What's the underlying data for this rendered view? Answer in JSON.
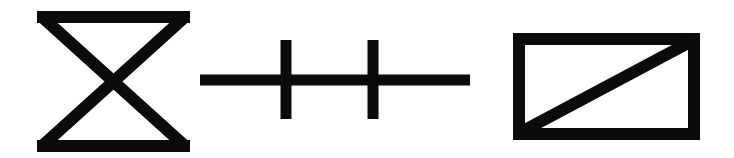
{
  "canvas": {
    "width": 734,
    "height": 158,
    "background_color": "#ffffff",
    "ink_color": "#0b0b0b",
    "description": "Three black line-art symbols arranged in a horizontal row on a plain white background"
  },
  "symbols": [
    {
      "id": "bowtie",
      "name": "bowtie-hourglass-symbol",
      "label": "Bowtie / hourglass (X between horizontal bars)",
      "order": 1,
      "bbox": {
        "x": 37,
        "y": 11,
        "width": 153,
        "height": 141
      },
      "stroke_width": 12,
      "geometry": {
        "top_bar": {
          "x1": 37,
          "y1": 17,
          "x2": 190,
          "y2": 17
        },
        "bottom_bar": {
          "x1": 37,
          "y1": 146,
          "x2": 190,
          "y2": 146
        },
        "diagonal_a": {
          "x1": 41,
          "y1": 16,
          "x2": 186,
          "y2": 147
        },
        "diagonal_b": {
          "x1": 186,
          "y1": 16,
          "x2": 41,
          "y2": 147
        },
        "crossing_point": {
          "x": 113,
          "y": 82
        }
      }
    },
    {
      "id": "double-cross-line",
      "name": "double-cross-line-symbol",
      "label": "Horizontal line crossed by two vertical bars",
      "order": 2,
      "bbox": {
        "x": 200,
        "y": 40,
        "width": 270,
        "height": 79
      },
      "stroke_width": 11,
      "geometry": {
        "horizontal_bar": {
          "x1": 200,
          "y1": 80,
          "x2": 470,
          "y2": 80
        },
        "vertical_bar_left": {
          "x1": 286,
          "y1": 40,
          "x2": 286,
          "y2": 119
        },
        "vertical_bar_right": {
          "x1": 373,
          "y1": 40,
          "x2": 373,
          "y2": 119
        }
      }
    },
    {
      "id": "crossed-rectangle",
      "name": "rectangle-with-diagonal-symbol",
      "label": "Rectangle with diagonal from bottom-left to top-right",
      "order": 3,
      "bbox": {
        "x": 513,
        "y": 33,
        "width": 187,
        "height": 107
      },
      "stroke_width": 12,
      "geometry": {
        "rect": {
          "x": 513,
          "y": 33,
          "width": 187,
          "height": 107
        },
        "diagonal": {
          "x1": 521,
          "y1": 132,
          "x2": 692,
          "y2": 41
        }
      }
    }
  ]
}
